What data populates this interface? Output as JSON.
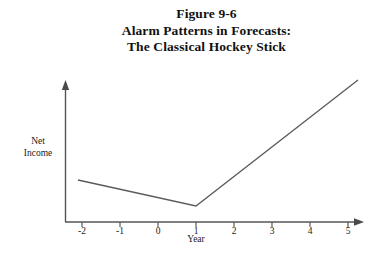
{
  "figure": {
    "title_lines": [
      "Figure 9-6",
      "Alarm Patterns in Forecasts:",
      "The Classical Hockey Stick"
    ]
  },
  "chart_data": {
    "type": "line",
    "title": "Figure 9-6 Alarm Patterns in Forecasts: The Classical Hockey Stick",
    "xlabel": "Year",
    "ylabel": "Net Income",
    "x_tick_labels": [
      "-2",
      "-1",
      "0",
      "1",
      "2",
      "3",
      "4",
      "5"
    ],
    "x": [
      -2,
      -1,
      0,
      1,
      2,
      3,
      4,
      5
    ],
    "xlim": [
      -2.4,
      5.3
    ],
    "grid": false,
    "legend": false,
    "axis_arrows": true,
    "y_axis_ticks": false,
    "series": [
      {
        "name": "Net Income",
        "comment": "Gentle decline from year -2 to the year-1 trough, then a steep linear rise through year 5 (hockey-stick shape). Values are unitless relative levels read off the plot.",
        "values": [
          0.3,
          0.24,
          0.17,
          0.11,
          0.4,
          0.68,
          0.96,
          1.22
        ]
      }
    ],
    "vertices": {
      "start": {
        "x": -2,
        "y": 0.3
      },
      "trough": {
        "x": 1,
        "y": 0.11
      },
      "end": {
        "x": 5,
        "y": 1.22
      }
    }
  },
  "style": {
    "line_color": "#555555",
    "axis_color": "#555555",
    "background": "#ffffff",
    "text_color": "#1a1a1a"
  },
  "axis_geometry": {
    "tick_positions_px": [
      82,
      120,
      158,
      196,
      234,
      272,
      310,
      348
    ],
    "x_axis_y_px": 222,
    "y_axis_x_px": 65,
    "year_title_center_px": 196
  }
}
